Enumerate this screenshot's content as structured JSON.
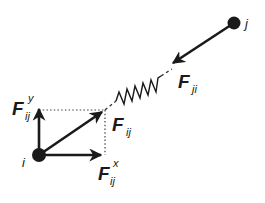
{
  "diagram": {
    "nodes": [
      {
        "id": "i",
        "label": "i"
      },
      {
        "id": "j",
        "label": "j"
      }
    ],
    "forces": {
      "f_ij": {
        "main": "F",
        "sub": "ij"
      },
      "f_ji": {
        "main": "F",
        "sub": "ji"
      },
      "f_ij_x": {
        "main": "F",
        "sub": "ij",
        "sup": "x"
      },
      "f_ij_y": {
        "main": "F",
        "sub": "ij",
        "sup": "y"
      }
    },
    "colors": {
      "ink": "#1a1a1a",
      "background": "#ffffff"
    }
  }
}
